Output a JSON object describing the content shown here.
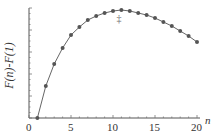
{
  "chart_data": {
    "type": "line",
    "title": "",
    "xlabel": "n",
    "ylabel": "F(n)-F(1)",
    "x_ticks": [
      "0",
      "5",
      "10",
      "15",
      "20"
    ],
    "x": [
      1,
      2,
      3,
      4,
      5,
      6,
      7,
      8,
      9,
      10,
      11,
      12,
      13,
      14,
      15,
      16,
      17,
      18,
      19,
      20
    ],
    "series": [
      {
        "name": "F(n)-F(1)",
        "values": [
          0,
          32,
          54,
          70,
          83,
          91,
          98,
          102,
          105,
          107,
          108,
          107,
          105,
          103,
          100,
          96,
          92,
          87,
          82,
          76
        ]
      }
    ],
    "annotation": "‡",
    "annotation_x": 11,
    "xlim": [
      0,
      21
    ],
    "ylim": [
      0,
      110
    ],
    "grid": false,
    "y_units": "relative (unlabeled axis)"
  }
}
